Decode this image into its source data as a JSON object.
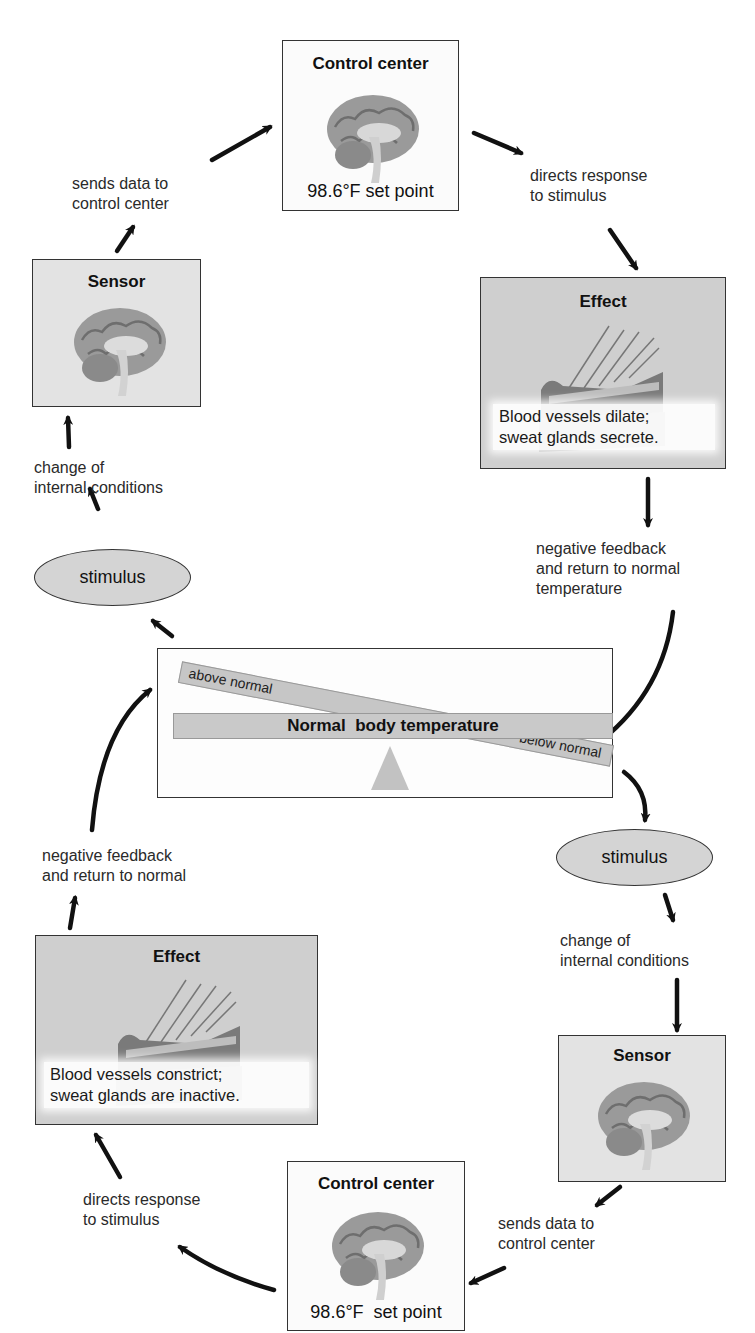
{
  "diagram": {
    "colors": {
      "box_border": "#333333",
      "effect_box_bg": "#cfcfcf",
      "sensor_box_bg": "#e3e3e3",
      "ellipse_bg": "#d4d4d4",
      "arrow": "#111111"
    },
    "center": {
      "label": "Normal  body temperature",
      "above_label": "above normal",
      "below_label": "below normal",
      "icon": "seesaw-balance-icon"
    },
    "upper_loop": {
      "stimulus": "stimulus",
      "change_label": "change of internal conditions",
      "change_lines": [
        "change of",
        "internal conditions"
      ],
      "sensor": {
        "title": "Sensor",
        "icon": "brain-icon"
      },
      "sends_lines": [
        "sends data to",
        "control center"
      ],
      "control_center": {
        "title": "Control center",
        "set_point": "98.6°F set point",
        "icon": "brain-icon"
      },
      "directs_lines": [
        "directs response",
        "to stimulus"
      ],
      "effect": {
        "title": "Effect",
        "icon": "skin-cross-section-icon",
        "lines": [
          "Blood vessels dilate;",
          "sweat glands secrete."
        ]
      },
      "feedback_lines": [
        "negative feedback",
        "and return to normal",
        "temperature"
      ]
    },
    "lower_loop": {
      "stimulus": "stimulus",
      "change_lines": [
        "change of",
        "internal conditions"
      ],
      "sensor": {
        "title": "Sensor",
        "icon": "brain-icon"
      },
      "sends_lines": [
        "sends data to",
        "control center"
      ],
      "control_center": {
        "title": "Control center",
        "set_point": "98.6°F  set point",
        "icon": "brain-icon"
      },
      "directs_lines": [
        "directs response",
        "to stimulus"
      ],
      "effect": {
        "title": "Effect",
        "icon": "skin-cross-section-icon",
        "lines": [
          "Blood vessels constrict;",
          "sweat glands are inactive."
        ]
      },
      "feedback_lines": [
        "negative feedback",
        "and return to normal"
      ]
    }
  }
}
